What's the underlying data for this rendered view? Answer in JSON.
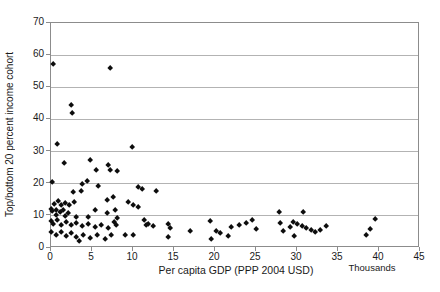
{
  "chart_data": {
    "type": "scatter",
    "title": "",
    "xlabel": "Per capita GDP (PPP 2004 USD)",
    "x_unit_note": "Thousands",
    "ylabel": "Top/bottom 20 percent income cohort",
    "xlim": [
      0,
      45
    ],
    "ylim": [
      0,
      70
    ],
    "x_ticks": [
      0,
      5,
      10,
      15,
      20,
      25,
      30,
      35,
      40,
      45
    ],
    "y_ticks": [
      0,
      10,
      20,
      30,
      40,
      50,
      60,
      70
    ],
    "grid": "horizontal",
    "legend": "none",
    "marker": "diamond",
    "marker_color": "#0d0d0d",
    "gridline_color": "#b3b3b3",
    "axis_color": "#8c8c8c",
    "points": [
      [
        0.4,
        57
      ],
      [
        7.3,
        55.5
      ],
      [
        2.6,
        44
      ],
      [
        2.7,
        41.5
      ],
      [
        0.9,
        32
      ],
      [
        10,
        31
      ],
      [
        1.7,
        26
      ],
      [
        4.9,
        27
      ],
      [
        5.6,
        24
      ],
      [
        7.15,
        25.5
      ],
      [
        7.3,
        24
      ],
      [
        8.25,
        23.5
      ],
      [
        0.3,
        20.3
      ],
      [
        3.9,
        19.6
      ],
      [
        4.5,
        20.5
      ],
      [
        2.8,
        17.2
      ],
      [
        3.8,
        17.5
      ],
      [
        5.9,
        19
      ],
      [
        10.7,
        18.7
      ],
      [
        11.2,
        18
      ],
      [
        13,
        17.3
      ],
      [
        7.7,
        15.6
      ],
      [
        7.0,
        14.7
      ],
      [
        0.5,
        13.3
      ],
      [
        1.0,
        14.2
      ],
      [
        1.4,
        13
      ],
      [
        1.9,
        13.7
      ],
      [
        2.4,
        13
      ],
      [
        3.0,
        14
      ],
      [
        9.5,
        13.9
      ],
      [
        10.1,
        13.1
      ],
      [
        10.7,
        12.3
      ],
      [
        0.2,
        11.9
      ],
      [
        0.3,
        11.2
      ],
      [
        0.7,
        11.6
      ],
      [
        1.2,
        10.9
      ],
      [
        1.6,
        11.4
      ],
      [
        2.2,
        10.6
      ],
      [
        5.5,
        11.4
      ],
      [
        7.0,
        10.6
      ],
      [
        28,
        10.7
      ],
      [
        30.9,
        10.9
      ],
      [
        0.8,
        9.9
      ],
      [
        1.8,
        9.6
      ],
      [
        3.2,
        9.4
      ],
      [
        4.7,
        9.2
      ],
      [
        0.2,
        7.9
      ],
      [
        0.4,
        7.2
      ],
      [
        0.9,
        8.2
      ],
      [
        1.4,
        6.9
      ],
      [
        2.0,
        7.8
      ],
      [
        2.6,
        6.7
      ],
      [
        3.2,
        7.5
      ],
      [
        3.9,
        6.5
      ],
      [
        4.7,
        7.2
      ],
      [
        5.5,
        6.2
      ],
      [
        6.3,
        6.9
      ],
      [
        7.1,
        5.9
      ],
      [
        0.2,
        4.7
      ],
      [
        0.8,
        3.8
      ],
      [
        1.4,
        4.5
      ],
      [
        2.0,
        3.4
      ],
      [
        2.6,
        4.2
      ],
      [
        3.2,
        3.1
      ],
      [
        4.1,
        3.8
      ],
      [
        4.9,
        2.8
      ],
      [
        5.7,
        3.6
      ],
      [
        6.7,
        2.5
      ],
      [
        7.5,
        3.6
      ],
      [
        3.6,
        1.8
      ],
      [
        8.0,
        11.6
      ],
      [
        7.8,
        7.8
      ],
      [
        8.2,
        9.0
      ],
      [
        8.1,
        6.9
      ],
      [
        11.5,
        8.2
      ],
      [
        12.0,
        7.2
      ],
      [
        11.7,
        6.7
      ],
      [
        12.6,
        6.5
      ],
      [
        14.4,
        7.0
      ],
      [
        14.6,
        5.7
      ],
      [
        9.2,
        3.6
      ],
      [
        10.1,
        3.6
      ],
      [
        14.4,
        3.0
      ],
      [
        17.1,
        5.0
      ],
      [
        19.5,
        7.9
      ],
      [
        19.7,
        2.5
      ],
      [
        20.3,
        4.9
      ],
      [
        20.7,
        4.2
      ],
      [
        21.7,
        3.5
      ],
      [
        22.1,
        6.1
      ],
      [
        23.1,
        6.9
      ],
      [
        23.9,
        7.3
      ],
      [
        24.7,
        8.2
      ],
      [
        25.1,
        5.6
      ],
      [
        28.1,
        7.3
      ],
      [
        28.4,
        4.9
      ],
      [
        29.3,
        6.1
      ],
      [
        29.7,
        7.6
      ],
      [
        30.2,
        7.1
      ],
      [
        30.7,
        6.6
      ],
      [
        29.8,
        3.5
      ],
      [
        31.2,
        5.9
      ],
      [
        31.8,
        5.1
      ],
      [
        32.4,
        4.6
      ],
      [
        33.0,
        5.3
      ],
      [
        33.7,
        6.6
      ],
      [
        38.5,
        3.8
      ],
      [
        39.1,
        5.6
      ],
      [
        39.7,
        8.5
      ]
    ]
  }
}
